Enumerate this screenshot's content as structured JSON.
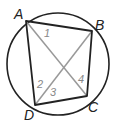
{
  "diagram": {
    "circle": {
      "cx": 58,
      "cy": 64,
      "r": 51,
      "color": "#222222"
    },
    "vertices": [
      {
        "name": "A",
        "x": 26,
        "y": 21,
        "label_x": 14,
        "label_y": 19
      },
      {
        "name": "B",
        "x": 92,
        "y": 31,
        "label_x": 95,
        "label_y": 30
      },
      {
        "name": "C",
        "x": 87,
        "y": 96,
        "label_x": 88,
        "label_y": 112
      },
      {
        "name": "D",
        "x": 35,
        "y": 105,
        "label_x": 24,
        "label_y": 120
      }
    ],
    "sides_color": "#222222",
    "diagonals_color": "#999999",
    "angle_labels": [
      {
        "text": "1",
        "x": 44,
        "y": 37
      },
      {
        "text": "2",
        "x": 37,
        "y": 88
      },
      {
        "text": "3",
        "x": 50,
        "y": 96
      },
      {
        "text": "4",
        "x": 78,
        "y": 83
      }
    ]
  }
}
